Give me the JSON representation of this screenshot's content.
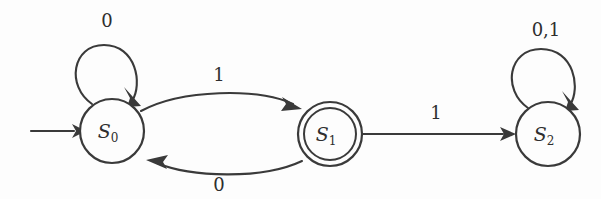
{
  "diagram": {
    "type": "finite-state-machine",
    "title": "",
    "background_color": "#fdfdfd",
    "line_color": "#3a3a3a",
    "text_color": "#2e2e2e",
    "alphabet": [
      "0",
      "1"
    ],
    "start_state": "S0",
    "accepting_states": [
      "S1"
    ],
    "states": [
      {
        "id": "S0",
        "label_base": "S",
        "label_sub": "0",
        "accepting": false,
        "is_start": true,
        "cx": 112,
        "cy": 131,
        "r": 32
      },
      {
        "id": "S1",
        "label_base": "S",
        "label_sub": "1",
        "accepting": true,
        "is_start": false,
        "cx": 330,
        "cy": 134,
        "r": 32,
        "r_inner": 26
      },
      {
        "id": "S2",
        "label_base": "S",
        "label_sub": "2",
        "accepting": false,
        "is_start": false,
        "cx": 548,
        "cy": 134,
        "r": 32
      }
    ],
    "transitions": [
      {
        "id": "t-s0-self",
        "from": "S0",
        "to": "S0",
        "symbol": "0",
        "kind": "self-loop",
        "label_x": 107,
        "label_y": 22
      },
      {
        "id": "t-s0-s1",
        "from": "S0",
        "to": "S1",
        "symbol": "1",
        "kind": "arc-above",
        "label_x": 219,
        "label_y": 76
      },
      {
        "id": "t-s1-s0",
        "from": "S1",
        "to": "S0",
        "symbol": "0",
        "kind": "arc-below",
        "label_x": 219,
        "label_y": 186
      },
      {
        "id": "t-s1-s2",
        "from": "S1",
        "to": "S2",
        "symbol": "1",
        "kind": "straight",
        "label_x": 436,
        "label_y": 114
      },
      {
        "id": "t-s2-self",
        "from": "S2",
        "to": "S2",
        "symbol": "0,1",
        "kind": "self-loop",
        "label_x": 546,
        "label_y": 31
      }
    ],
    "start_arrow": {
      "id": "start-arrow",
      "from_x": 31,
      "to_x": 80,
      "y": 131
    }
  }
}
